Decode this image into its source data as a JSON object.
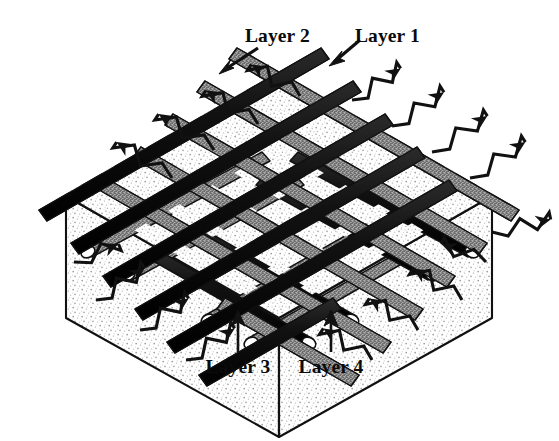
{
  "figure": {
    "kind": "diagram",
    "projection": "isometric",
    "background_color": "#ffffff",
    "ink_color": "#0b0b0b"
  },
  "labels": {
    "layer1": "Layer 1",
    "layer2": "Layer 2",
    "layer3": "Layer 3",
    "layer4": "Layer 4"
  },
  "layers": [
    {
      "id": "layer1",
      "label": "Layer 1",
      "fill": "solid-black",
      "color": "#111111",
      "direction": "lower-left-to-upper-right",
      "position": "top",
      "rod_count": 11,
      "pointer": "arrow-down-left"
    },
    {
      "id": "layer2",
      "label": "Layer 2",
      "fill": "stippled-gray",
      "color": "#7d7d7d",
      "direction": "lower-right-to-upper-left",
      "position": "second",
      "rod_count": 11,
      "pointer": "arrow-down-left"
    },
    {
      "id": "layer3",
      "label": "Layer 3",
      "fill": "stippled-gray",
      "color": "#7d7d7d",
      "direction": "lower-left-to-upper-right",
      "position": "third",
      "rod_count": 9,
      "pointer": "arrow-up",
      "end_cap": "open-circle"
    },
    {
      "id": "layer4",
      "label": "Layer 4",
      "fill": "solid-black",
      "color": "#111111",
      "direction": "lower-right-to-upper-left",
      "position": "fourth",
      "rod_count": 9,
      "pointer": "arrow-up",
      "end_cap": "open-circle"
    }
  ],
  "substrate": {
    "name": "substrate-block",
    "texture": "stipple",
    "outline_color": "#111111",
    "fill_color": "#f2f2f2",
    "shape": "hexagonal-prism-top-view"
  },
  "wave_arrows": {
    "style": "zigzag-with-solid-arrowhead",
    "outward_count": 12,
    "inward_count": 8,
    "color": "#111111"
  },
  "colors": {
    "black_rod": "#111111",
    "gray_rod": "#7d7d7d",
    "stipple_light": "#dcdcdc",
    "paper": "#ffffff",
    "ink": "#0b0b0b"
  }
}
